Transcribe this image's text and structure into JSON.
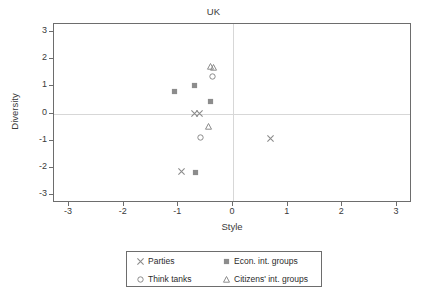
{
  "chart_data": {
    "type": "scatter",
    "title": "UK",
    "xlabel": "Style",
    "ylabel": "Diversity",
    "xlim": [
      -3,
      3
    ],
    "ylim": [
      -3,
      3
    ],
    "xticks": [
      "-3",
      "-2",
      "-1",
      "0",
      "1",
      "2",
      "3"
    ],
    "yticks": [
      "3",
      "2",
      "1",
      "0",
      "-1",
      "-2",
      "-3"
    ],
    "xtick_values": [
      -3,
      -2,
      -1,
      0,
      1,
      2,
      3
    ],
    "ytick_values": [
      3,
      2,
      1,
      0,
      -1,
      -2,
      -3
    ],
    "grid": "zero-lines-only",
    "legend_position": "below-axes",
    "marker_color": "#8c8c8c",
    "frame_color": "#6d6d6d",
    "gridline_color": "#d7d7d7",
    "series": [
      {
        "name": "Parties",
        "marker": "x",
        "points": [
          {
            "x": -0.7,
            "y": 0.0
          },
          {
            "x": -0.62,
            "y": 0.0
          },
          {
            "x": -0.95,
            "y": -2.15
          },
          {
            "x": 0.68,
            "y": -0.92
          }
        ]
      },
      {
        "name": "Think tanks",
        "marker": "circle",
        "points": [
          {
            "x": -0.37,
            "y": 1.35
          },
          {
            "x": -0.6,
            "y": -0.88
          }
        ]
      },
      {
        "name": "Econ. int. groups",
        "marker": "square",
        "points": [
          {
            "x": -1.08,
            "y": 0.8
          },
          {
            "x": -0.7,
            "y": 1.05
          },
          {
            "x": -0.42,
            "y": 0.43
          },
          {
            "x": -0.68,
            "y": -2.18
          }
        ]
      },
      {
        "name": "Citizens' int. groups",
        "marker": "triangle",
        "points": [
          {
            "x": -0.41,
            "y": 1.72
          },
          {
            "x": -0.36,
            "y": 1.7
          },
          {
            "x": -0.44,
            "y": -0.47
          }
        ]
      }
    ]
  },
  "legend": {
    "entries": [
      {
        "label": "Parties",
        "marker": "x"
      },
      {
        "label": "Econ. int. groups",
        "marker": "square"
      },
      {
        "label": "Think tanks",
        "marker": "circle"
      },
      {
        "label": "Citizens' int. groups",
        "marker": "triangle"
      }
    ]
  }
}
